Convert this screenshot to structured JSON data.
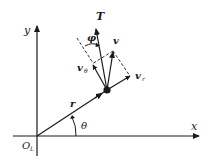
{
  "diagram": {
    "type": "polar-velocity-decomposition",
    "colors": {
      "stroke": "#1a1a1a",
      "background": "#ffffff"
    },
    "labels": {
      "x_axis": "x",
      "y_axis": "y",
      "origin": "O",
      "origin_sub": "L",
      "position_vector": "r",
      "angle_theta": "θ",
      "tangent": "T",
      "angle_phi": "φ",
      "velocity": "v",
      "velocity_theta": "v",
      "velocity_theta_sub": "θ",
      "velocity_r": "v",
      "velocity_r_sub": "r"
    }
  }
}
